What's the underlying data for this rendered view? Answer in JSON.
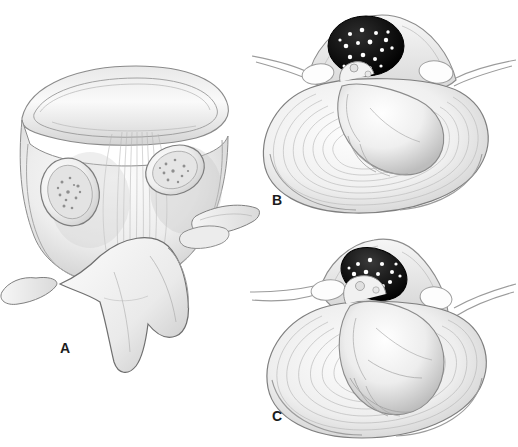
{
  "figure": {
    "type": "medical-anatomical-illustration",
    "subject": "Lumbar vertebra and intervertebral disc cross-sections showing disc herniation",
    "background_color": "#ffffff",
    "style": "grayscale pencil / stipple medical illustration",
    "width": 518,
    "height": 447
  },
  "panels": [
    {
      "id": "A",
      "label": "A",
      "label_x": 60,
      "label_y": 341,
      "view": "posterior-superior oblique view of vertebra with cut pedicles",
      "structures": [
        "vertebral body superior endplate",
        "cut pedicle cross-section left",
        "cut pedicle cross-section right",
        "trabecular cancellous bone",
        "posterior longitudinal ligament fibers",
        "spinous process",
        "transverse process left",
        "transverse process right",
        "superior articular process"
      ]
    },
    {
      "id": "B",
      "label": "B",
      "label_x": 272,
      "label_y": 193,
      "view": "axial cross-section of intervertebral disc with posterolateral herniation",
      "structures": [
        "annulus fibrosus concentric lamellae",
        "nucleus pulposus herniation",
        "spinal canal with cauda equina nerve roots",
        "facet joint left",
        "facet joint right",
        "transverse process left",
        "transverse process right",
        "spinous process"
      ]
    },
    {
      "id": "C",
      "label": "C",
      "label_x": 272,
      "label_y": 409,
      "view": "axial cross-section of intervertebral disc with larger central herniation compressing canal",
      "structures": [
        "annulus fibrosus concentric lamellae",
        "extruded nucleus pulposus",
        "compressed spinal canal with cauda equina nerve roots",
        "facet joint left",
        "facet joint right",
        "transverse process left",
        "transverse process right",
        "spinous process"
      ]
    }
  ],
  "colors": {
    "background": "#ffffff",
    "outline": "#6b6b6b",
    "outline_dark": "#3a3a3a",
    "bone_light": "#f2f2f2",
    "bone_mid": "#dcdcdc",
    "bone_shadow": "#a8a8a8",
    "annulus_light": "#f0f0f0",
    "annulus_fiber": "#bdbdbd",
    "canal_dark": "#141414",
    "nerve_root": "#ffffff",
    "label_text": "#1c1c1c"
  }
}
